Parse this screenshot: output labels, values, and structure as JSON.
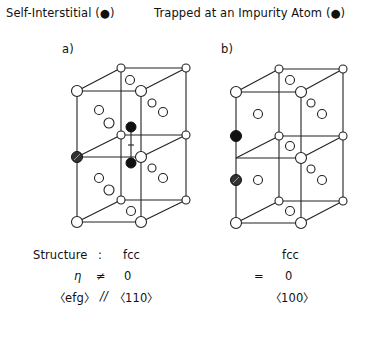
{
  "header": {
    "left_title": "Self-Interstitial (●)",
    "right_title": "Trapped at an Impurity Atom (●)"
  },
  "panels": [
    {
      "label": "a)",
      "structure": "fcc",
      "eta_relation": "≠",
      "eta_value": "0",
      "efg_relation": "//",
      "efg_direction": "〈110〉"
    },
    {
      "label": "b)",
      "structure": "fcc",
      "eta_relation": "=",
      "eta_value": "0",
      "efg_direction": "〈100〉"
    }
  ],
  "row_labels": {
    "structure": "Structure",
    "colon": ":",
    "eta": "η",
    "efg": "〈efg〉"
  },
  "colors": {
    "line": "#222222",
    "atom_fill": "#ffffff",
    "interstitial": "#111111",
    "impurity": "#333333"
  }
}
